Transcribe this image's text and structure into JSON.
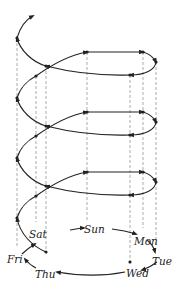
{
  "diagram": {
    "type": "spiral-of-weekdays",
    "colors": {
      "stroke": "#222222",
      "dashed": "#888888",
      "background": "#ffffff"
    },
    "days": [
      {
        "id": "sun",
        "label": "Sun"
      },
      {
        "id": "mon",
        "label": "Mon"
      },
      {
        "id": "tue",
        "label": "Tue"
      },
      {
        "id": "wed",
        "label": "Wed"
      },
      {
        "id": "thu",
        "label": "Thu"
      },
      {
        "id": "fri",
        "label": "Fri"
      },
      {
        "id": "sat",
        "label": "Sat"
      }
    ],
    "base_cycle_order": [
      "Sun",
      "Mon",
      "Tue",
      "Wed",
      "Thu",
      "Fri",
      "Sat",
      "Sun"
    ],
    "loops_count": 4
  }
}
